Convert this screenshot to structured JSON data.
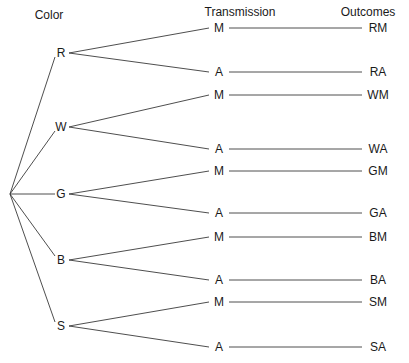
{
  "headers": {
    "color": "Color",
    "transmission": "Transmission",
    "outcomes": "Outcomes"
  },
  "root": {
    "x": 10,
    "y": 194
  },
  "colors": [
    {
      "label": "R",
      "y": 53
    },
    {
      "label": "W",
      "y": 127
    },
    {
      "label": "G",
      "y": 194
    },
    {
      "label": "B",
      "y": 260
    },
    {
      "label": "S",
      "y": 326
    }
  ],
  "transmissions": [
    {
      "label": "M",
      "y": 28,
      "outcome": "RM",
      "parent": 0
    },
    {
      "label": "A",
      "y": 72,
      "outcome": "RA",
      "parent": 0
    },
    {
      "label": "M",
      "y": 95,
      "outcome": "WM",
      "parent": 1
    },
    {
      "label": "A",
      "y": 149,
      "outcome": "WA",
      "parent": 1
    },
    {
      "label": "M",
      "y": 171,
      "outcome": "GM",
      "parent": 2
    },
    {
      "label": "A",
      "y": 213,
      "outcome": "GA",
      "parent": 2
    },
    {
      "label": "M",
      "y": 237,
      "outcome": "BM",
      "parent": 3
    },
    {
      "label": "A",
      "y": 280,
      "outcome": "BA",
      "parent": 3
    },
    {
      "label": "M",
      "y": 302,
      "outcome": "SM",
      "parent": 4
    },
    {
      "label": "A",
      "y": 347,
      "outcome": "SA",
      "parent": 4
    }
  ],
  "line_color": "#3a3a3a"
}
